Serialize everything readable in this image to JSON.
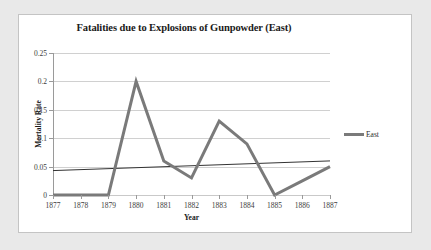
{
  "page": {
    "background_color": "#e9e9e9",
    "panel_background_color": "#ffffff",
    "panel_border_color": "#c4c4c4"
  },
  "chart_data": {
    "type": "line",
    "title": "Fatalities due to Explosions of Gunpowder (East)",
    "xlabel": "Year",
    "ylabel": "Mortality Rate",
    "categories": [
      "1877",
      "1878",
      "1879",
      "1880",
      "1881",
      "1882",
      "1883",
      "1884",
      "1885",
      "1886",
      "1887"
    ],
    "x": [
      1877,
      1878,
      1879,
      1880,
      1881,
      1882,
      1883,
      1884,
      1885,
      1886,
      1887
    ],
    "series": [
      {
        "name": "East",
        "color": "#7a7a7a",
        "line_width": 3,
        "values": [
          0,
          0,
          0,
          0.2,
          0.06,
          0.03,
          0.13,
          0.09,
          0,
          0.025,
          0.05
        ]
      }
    ],
    "trendline": {
      "name": "Linear trend",
      "color": "#333333",
      "line_width": 1,
      "start_value": 0.043,
      "end_value": 0.06
    },
    "ylim": [
      0,
      0.25
    ],
    "ytick_values": [
      0,
      0.05,
      0.1,
      0.15,
      0.2,
      0.25
    ],
    "ytick_labels": [
      "0",
      "0.05",
      "0.1",
      "0.15",
      "0.2",
      "0.25"
    ],
    "grid": true,
    "grid_color": "#d0d0d0",
    "legend_position": "right",
    "legend_entries": [
      "East"
    ]
  }
}
